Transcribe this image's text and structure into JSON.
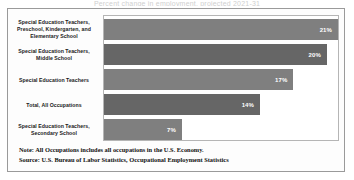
{
  "title_sliver": "Percent change in employment, projected 2021-31",
  "chart_data": {
    "type": "bar",
    "orientation": "horizontal",
    "title": "",
    "xlabel": "",
    "ylabel": "",
    "grid": false,
    "legend": null,
    "xlim": [
      0,
      21
    ],
    "categories": [
      "Special Education Teachers, Preschool, Kindergarten, and Elementary School",
      "Special Education Teachers, Middle School",
      "Special Education Teachers",
      "Total, All Occupations",
      "Special Education Teachers, Secondary School"
    ],
    "values": [
      21,
      20,
      17,
      14,
      7
    ],
    "value_labels": [
      "21%",
      "20%",
      "17%",
      "14%",
      "7%"
    ],
    "bar_colors": [
      "#7f7f7f",
      "#666666",
      "#7f7f7f",
      "#666666",
      "#7f7f7f"
    ]
  },
  "footer": {
    "note": "Note: All Occupations includes all occupations in the U.S. Economy.",
    "source": "Source: U.S. Bureau of Labor Statistics, Occupational Employment Statistics"
  }
}
